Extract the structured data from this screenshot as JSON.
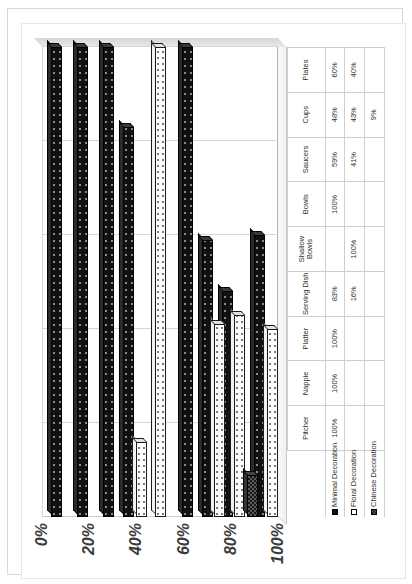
{
  "chart_data": {
    "type": "bar",
    "orientation": "horizontal",
    "title": "",
    "xlabel": "",
    "ylabel": "",
    "ylim": [
      0,
      100
    ],
    "axis_ticks": [
      "0%",
      "20%",
      "40%",
      "60%",
      "80%",
      "100%"
    ],
    "grid": true,
    "legend_position": "bottom-left",
    "categories": [
      "Plates",
      "Cups",
      "Saucers",
      "Bowls",
      "Shallow Bowls",
      "Serving Dish",
      "Platter",
      "Nappie",
      "Pitcher"
    ],
    "series": [
      {
        "name": "Minimal Decoration",
        "color": "#111111",
        "pattern": "speckle",
        "values": [
          60,
          48,
          59,
          100,
          null,
          83,
          100,
          100,
          100
        ],
        "labels": [
          "60%",
          "48%",
          "59%",
          "100%",
          "",
          "83%",
          "100%",
          "100%",
          "100%"
        ]
      },
      {
        "name": "Floral Decoration",
        "color": "#ffffff",
        "pattern": "fine-dots",
        "values": [
          40,
          43,
          41,
          null,
          100,
          16,
          null,
          null,
          null
        ],
        "labels": [
          "40%",
          "43%",
          "41%",
          "",
          "100%",
          "16%",
          "",
          "",
          ""
        ]
      },
      {
        "name": "Chinese Decoration",
        "color": "#181818",
        "pattern": "checker",
        "values": [
          null,
          9,
          null,
          null,
          null,
          null,
          null,
          null,
          null
        ],
        "labels": [
          "",
          "9%",
          "",
          "",
          "",
          "",
          "",
          "",
          ""
        ]
      }
    ]
  },
  "legend": {
    "items": [
      {
        "label": "Minimal Decoration",
        "swatch": "minimal-swatch"
      },
      {
        "label": "Floral Decoration",
        "swatch": "floral-swatch"
      },
      {
        "label": "Chinese Decoration",
        "swatch": "chinese-swatch"
      }
    ]
  },
  "table": {
    "corner": "",
    "row_headers": [
      "Minimal Decoration",
      "Floral Decoration",
      "Chinese Decoration"
    ]
  }
}
